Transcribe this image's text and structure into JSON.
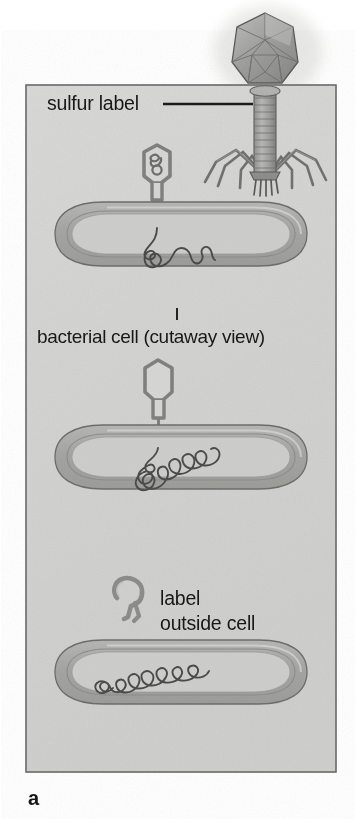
{
  "figure": {
    "panel_letter": "a",
    "labels": {
      "sulfur_label": "sulfur label",
      "bacterial_cell": "bacterial cell (cutaway view)",
      "label_outside_line1": "label",
      "label_outside_line2": "outside cell"
    },
    "icons": {
      "phage": "bacteriophage-icon",
      "phage_ghost": "phage-ghost-icon",
      "bacterium": "bacterial-cell-icon",
      "dna": "dna-strand-icon",
      "leader_line": "leader-line-icon",
      "leader_tick": "leader-tick-icon"
    },
    "colors": {
      "page_background": "#ffffff",
      "panel_background": "#d6d6d4",
      "panel_border": "#6e6e6e",
      "cell_wall_outer": "#a8a8a6",
      "cell_wall_stroke": "#6b6b6b",
      "cell_interior": "#c9c9c7",
      "cell_highlight": "#e2e2e0",
      "phage_body": "#9a9a98",
      "phage_stroke": "#5e5e5e",
      "dna_stroke": "#4a4a4a",
      "text": "#171717",
      "leader_line": "#1a1a1a"
    },
    "stages": [
      {
        "name": "stage-1-attachment",
        "description": "Labeled phage attached to bacterial cell, DNA being injected",
        "phage_head_contains_dna": true,
        "phage_attached": true
      },
      {
        "name": "stage-2-injection-complete",
        "description": "Empty phage ghost still attached, DNA coiled inside cell",
        "phage_head_contains_dna": false,
        "phage_attached": true
      },
      {
        "name": "stage-3-ghost-detached",
        "description": "Labeled protein coat detached outside cell, DNA inside cell",
        "phage_head_contains_dna": false,
        "phage_attached": false
      }
    ]
  }
}
